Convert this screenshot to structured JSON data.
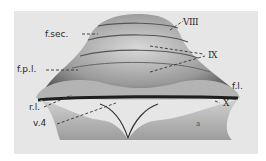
{
  "figure": {
    "labels": [
      {
        "id": "f_sec",
        "text": "f.sec."
      },
      {
        "id": "viii",
        "text": "VIII"
      },
      {
        "id": "ix",
        "text": "IX"
      },
      {
        "id": "f_p_l",
        "text": "f.p.l."
      },
      {
        "id": "f_l",
        "text": "f.l."
      },
      {
        "id": "r_l",
        "text": "r.l."
      },
      {
        "id": "x",
        "text": "X"
      },
      {
        "id": "v4",
        "text": "v.4"
      },
      {
        "id": "a",
        "text": "a"
      }
    ]
  }
}
